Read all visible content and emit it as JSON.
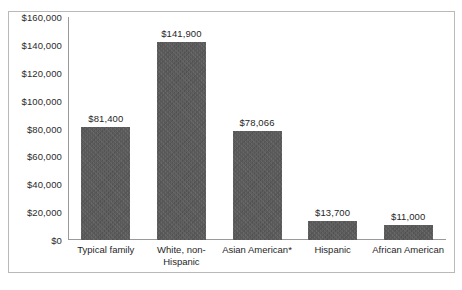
{
  "chart_data": {
    "type": "bar",
    "title": "",
    "subtitle": "",
    "xlabel": "",
    "ylabel": "",
    "categories": [
      "Typical family",
      "White, non-\nHispanic",
      "Asian American*",
      "Hispanic",
      "African American"
    ],
    "values": [
      81400,
      141900,
      78066,
      13700,
      11000
    ],
    "data_labels": [
      "$81,400",
      "$141,900",
      "$78,066",
      "$13,700",
      "$11,000"
    ],
    "ylim": [
      0,
      160000
    ],
    "y_ticks": [
      0,
      20000,
      40000,
      60000,
      80000,
      100000,
      120000,
      140000,
      160000
    ],
    "y_tick_labels": [
      "$0",
      "$20,000",
      "$40,000",
      "$60,000",
      "$80,000",
      "$100,000",
      "$120,000",
      "$140,000",
      "$160,000"
    ],
    "grid": false,
    "legend": false,
    "legend_position": "none",
    "series": [
      {
        "name": "Median net worth",
        "values": [
          81400,
          141900,
          78066,
          13700,
          11000
        ],
        "color": "#595959"
      }
    ],
    "annotations": [
      "*"
    ],
    "colors": {
      "bar_fill": "#595959",
      "axis_line": "#9a9a9a",
      "frame_border": "#b9b9b9",
      "text": "#1f1f1f",
      "background": "#ffffff"
    }
  }
}
